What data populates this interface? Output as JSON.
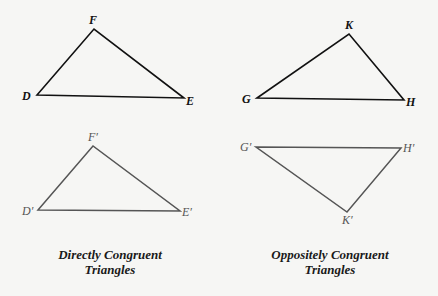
{
  "colors": {
    "background": "#f6f6f4",
    "original_stroke": "#111111",
    "image_stroke": "#555555"
  },
  "triangles": {
    "def": {
      "vertices": [
        {
          "label": "D",
          "x": 37,
          "y": 95,
          "lx": 22,
          "ly": 100
        },
        {
          "label": "F",
          "x": 94,
          "y": 29,
          "lx": 89,
          "ly": 24
        },
        {
          "label": "E",
          "x": 184,
          "y": 98,
          "lx": 186,
          "ly": 105
        }
      ]
    },
    "ghk": {
      "vertices": [
        {
          "label": "G",
          "x": 257,
          "y": 98,
          "lx": 242,
          "ly": 103
        },
        {
          "label": "K",
          "x": 349,
          "y": 34,
          "lx": 345,
          "ly": 29
        },
        {
          "label": "H",
          "x": 404,
          "y": 100,
          "lx": 406,
          "ly": 106
        }
      ]
    },
    "def_prime": {
      "vertices": [
        {
          "label": "D′",
          "x": 38,
          "y": 210,
          "lx": 22,
          "ly": 215
        },
        {
          "label": "F′",
          "x": 93,
          "y": 146,
          "lx": 88,
          "ly": 141
        },
        {
          "label": "E′",
          "x": 180,
          "y": 211,
          "lx": 182,
          "ly": 216
        }
      ]
    },
    "ghk_prime": {
      "vertices": [
        {
          "label": "G′",
          "x": 256,
          "y": 147,
          "lx": 240,
          "ly": 151
        },
        {
          "label": "H′",
          "x": 401,
          "y": 148,
          "lx": 403,
          "ly": 152
        },
        {
          "label": "K′",
          "x": 347,
          "y": 212,
          "lx": 342,
          "ly": 224
        }
      ]
    }
  },
  "captions": {
    "left_line1": "Directly Congruent",
    "left_line2": "Triangles",
    "right_line1": "Oppositely Congruent",
    "right_line2": "Triangles"
  }
}
